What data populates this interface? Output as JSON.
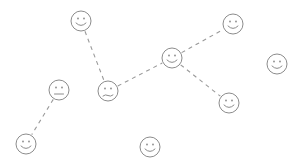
{
  "diagram": {
    "width": 303,
    "height": 167,
    "background": "#ffffff",
    "stroke_color": "#8c8c8c",
    "edge_color": "#9a9a9a",
    "face_radius": 10,
    "nodes": [
      {
        "id": "A",
        "x": 81,
        "y": 21,
        "expression": "smile"
      },
      {
        "id": "B",
        "x": 59,
        "y": 90,
        "expression": "neutral"
      },
      {
        "id": "C",
        "x": 108,
        "y": 91,
        "expression": "frown"
      },
      {
        "id": "D",
        "x": 172,
        "y": 58,
        "expression": "smile"
      },
      {
        "id": "E",
        "x": 233,
        "y": 24,
        "expression": "smile"
      },
      {
        "id": "F",
        "x": 277,
        "y": 64,
        "expression": "smile"
      },
      {
        "id": "G",
        "x": 229,
        "y": 103,
        "expression": "smile"
      },
      {
        "id": "H",
        "x": 26,
        "y": 144,
        "expression": "smile"
      },
      {
        "id": "I",
        "x": 150,
        "y": 147,
        "expression": "smile"
      }
    ],
    "edges": [
      {
        "from": "A",
        "to": "C",
        "style": "dashed"
      },
      {
        "from": "C",
        "to": "D",
        "style": "dashed"
      },
      {
        "from": "D",
        "to": "E",
        "style": "dashed"
      },
      {
        "from": "D",
        "to": "G",
        "style": "dashed"
      },
      {
        "from": "B",
        "to": "H",
        "style": "dashed"
      }
    ]
  }
}
